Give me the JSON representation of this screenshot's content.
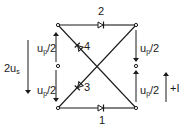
{
  "diagram": {
    "type": "bridge-rectifier-circuit",
    "labels": {
      "diode_top": "2",
      "diode_bottom": "1",
      "diode_upper_left": "4",
      "diode_lower_left": "3",
      "left_upper_voltage": "u",
      "left_upper_voltage_sub": "p",
      "left_upper_voltage_suffix": "/2",
      "left_lower_voltage": "u",
      "left_lower_voltage_sub": "p",
      "left_lower_voltage_suffix": "/2",
      "right_upper_voltage": "u",
      "right_upper_voltage_sub": "p",
      "right_upper_voltage_suffix": "/2",
      "right_lower_voltage": "u",
      "right_lower_voltage_sub": "p",
      "right_lower_voltage_suffix": "/2",
      "source_voltage_prefix": "2u",
      "source_voltage_sub": "s",
      "current_label": "+I"
    },
    "colors": {
      "line": "#1a1a1a",
      "background": "#ffffff"
    }
  }
}
